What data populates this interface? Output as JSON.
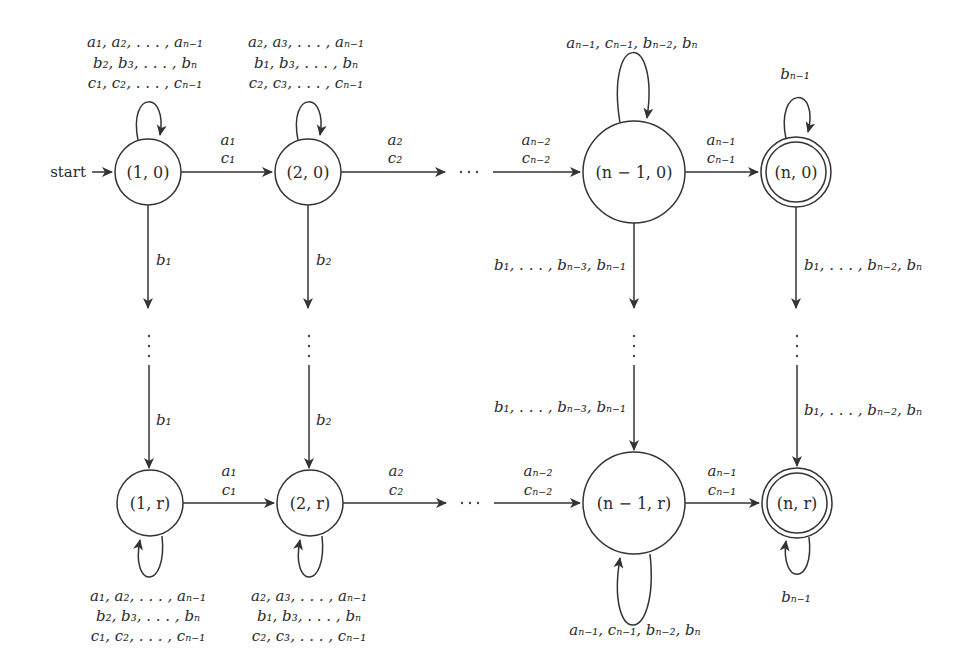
{
  "diagram": {
    "type": "finite automaton (state diagram)",
    "start_label": "start",
    "states": [
      {
        "id": "s10",
        "label": "(1, 0)",
        "accepting": false,
        "start": true
      },
      {
        "id": "s20",
        "label": "(2, 0)",
        "accepting": false
      },
      {
        "id": "sn10",
        "label": "(n − 1, 0)",
        "accepting": false
      },
      {
        "id": "sn0",
        "label": "(n, 0)",
        "accepting": true
      },
      {
        "id": "s1r",
        "label": "(1, r)",
        "accepting": false
      },
      {
        "id": "s2r",
        "label": "(2, r)",
        "accepting": false
      },
      {
        "id": "sn1r",
        "label": "(n − 1, r)",
        "accepting": false
      },
      {
        "id": "snr",
        "label": "(n, r)",
        "accepting": true
      }
    ],
    "loops": {
      "s10": [
        "a₁, a₂, . . . , aₙ₋₁",
        "b₂, b₃, . . . , bₙ",
        "c₁, c₂, . . . , cₙ₋₁"
      ],
      "s20": [
        "a₂, a₃, . . . , aₙ₋₁",
        "b₁, b₃, . . . , bₙ",
        "c₂, c₃, . . . , cₙ₋₁"
      ],
      "sn10": [
        "aₙ₋₁, cₙ₋₁, bₙ₋₂, bₙ"
      ],
      "sn0": [
        "bₙ₋₁"
      ],
      "s1r": [
        "a₁, a₂, . . . , aₙ₋₁",
        "b₂, b₃, . . . , bₙ",
        "c₁, c₂, . . . , cₙ₋₁"
      ],
      "s2r": [
        "a₂, a₃, . . . , aₙ₋₁",
        "b₁, b₃, . . . , bₙ",
        "c₂, c₃, . . . , cₙ₋₁"
      ],
      "sn1r": [
        "aₙ₋₁, cₙ₋₁, bₙ₋₂, bₙ"
      ],
      "snr": [
        "bₙ₋₁"
      ]
    },
    "horizontal_edges": {
      "row0": [
        {
          "from": "s10",
          "to": "s20",
          "label_top": "a₁",
          "label_bottom": "c₁"
        },
        {
          "from": "s20",
          "to": "…",
          "label_top": "a₂",
          "label_bottom": "c₂"
        },
        {
          "from": "…",
          "to": "sn10",
          "label_top": "aₙ₋₂",
          "label_bottom": "cₙ₋₂"
        },
        {
          "from": "sn10",
          "to": "sn0",
          "label_top": "aₙ₋₁",
          "label_bottom": "cₙ₋₁"
        }
      ],
      "rowr": [
        {
          "from": "s1r",
          "to": "s2r",
          "label_top": "a₁",
          "label_bottom": "c₁"
        },
        {
          "from": "s2r",
          "to": "…",
          "label_top": "a₂",
          "label_bottom": "c₂"
        },
        {
          "from": "…",
          "to": "sn1r",
          "label_top": "aₙ₋₂",
          "label_bottom": "cₙ₋₂"
        },
        {
          "from": "sn1r",
          "to": "snr",
          "label_top": "aₙ₋₁",
          "label_bottom": "cₙ₋₁"
        }
      ]
    },
    "vertical_edges": {
      "col1": {
        "upper": "b₁",
        "lower": "b₁"
      },
      "col2": {
        "upper": "b₂",
        "lower": "b₂"
      },
      "coln1": {
        "upper": "b₁, . . . , bₙ₋₃, bₙ₋₁",
        "lower": "b₁, . . . , bₙ₋₃, bₙ₋₁"
      },
      "coln": {
        "upper": "b₁, . . . , bₙ₋₂, bₙ",
        "lower": "b₁, . . . , bₙ₋₂, bₙ"
      }
    },
    "ellipsis_horizontal": "· · ·",
    "ellipsis_vertical": "⋮"
  }
}
